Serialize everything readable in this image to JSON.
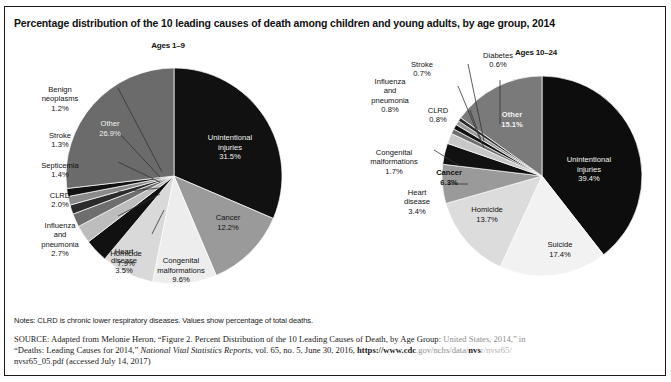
{
  "figure": {
    "title": "Percentage distribution of the 10 leading causes of death among children and young adults, by age group, 2014",
    "notes": "Notes: CLRD is chronic lower respiratory diseases. Values show percentage of total deaths.",
    "source": {
      "label": "SOURCE:",
      "part1": " Adapted from Melonie Heron, “Figure 2. Percent Distribution of the 10 Leading Causes of Death, by Age Group:",
      "part1_faded": " United States, 2014,” in",
      "part2_quote": "“Deaths: Leading Causes for 2014,” ",
      "part2_italic": "National Vital Statistics Reports",
      "part2_rest": ", vol. 65, no. 5, June 30, 2016, ",
      "url_bold": "https://www.cdc",
      "url_faded": ".gov/nchs/data/",
      "url_bold2": "nvs",
      "url_faded2": "r/nvsr65/",
      "part3": "nvsr65_05.pdf (accessed July 14, 2017)"
    }
  },
  "chart_data": [
    {
      "type": "pie",
      "title": "Ages 1–9",
      "panel": "left",
      "total_label": "percentage of total deaths",
      "categories": [
        "Unintentional injuries",
        "Cancer",
        "Congenital malformations",
        "Homicide",
        "Heart disease",
        "Influenza and pneumonia",
        "CLRD",
        "Septicemia",
        "Stroke",
        "Benign neoplasms",
        "Other"
      ],
      "values": [
        31.5,
        12.2,
        9.6,
        7.9,
        3.5,
        2.7,
        2.0,
        1.4,
        1.3,
        1.2,
        26.9
      ],
      "value_labels": [
        "31.5%",
        "12.2%",
        "9.6%",
        "7.9%",
        "3.5%",
        "2.7%",
        "2.0%",
        "1.4%",
        "1.3%",
        "1.2%",
        "26.9%"
      ],
      "colors": [
        "#111111",
        "#9a9a9a",
        "#ededed",
        "#d9d9d9",
        "#111111",
        "#bdbdbd",
        "#6e6e6e",
        "#2b2b2b",
        "#8a8a8a",
        "#111111",
        "#6b6b6b"
      ],
      "label_placement": [
        "inside",
        "inside",
        "inside",
        "inside",
        "leader",
        "leader",
        "leader",
        "leader",
        "leader",
        "leader",
        "inside"
      ]
    },
    {
      "type": "pie",
      "title": "Ages 10–24",
      "panel": "right",
      "categories": [
        "Unintentional injuries",
        "Suicide",
        "Homicide",
        "Cancer",
        "Heart disease",
        "Congenital malformations",
        "CLRD",
        "Influenza and pneumonia",
        "Stroke",
        "Diabetes",
        "Other"
      ],
      "values": [
        39.4,
        17.4,
        13.7,
        6.3,
        3.4,
        1.7,
        0.8,
        0.8,
        0.7,
        0.6,
        15.1
      ],
      "value_labels": [
        "39.4%",
        "17.4%",
        "13.7%",
        "6.3%",
        "3.4%",
        "1.7%",
        "0.8%",
        "0.8%",
        "0.7%",
        "0.6%",
        "15.1%"
      ],
      "colors": [
        "#0d0d0d",
        "#f2f2f2",
        "#dcdcdc",
        "#9a9a9a",
        "#111111",
        "#c8c8c8",
        "#6e6e6e",
        "#111111",
        "#9a9a9a",
        "#2b2b2b",
        "#7a7a7a"
      ],
      "label_placement": [
        "inside",
        "inside",
        "inside",
        "inside",
        "leader",
        "leader",
        "leader",
        "leader",
        "leader",
        "leader",
        "inside"
      ]
    }
  ]
}
